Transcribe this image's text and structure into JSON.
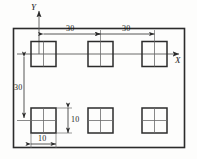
{
  "diagram": {
    "kind": "engineering-dimension-drawing",
    "colors": {
      "line": "#2b2b2b",
      "thin_line": "#5a5a5a",
      "background": "#fdfdfc",
      "text": "#1b1b1b"
    },
    "axes": {
      "x_label": "X",
      "y_label": "Y"
    },
    "dimensions": [
      {
        "name": "pitch-horizontal-1",
        "value": "30",
        "orientation": "horizontal"
      },
      {
        "name": "pitch-horizontal-2",
        "value": "30",
        "orientation": "horizontal"
      },
      {
        "name": "pitch-vertical",
        "value": "30",
        "orientation": "vertical"
      },
      {
        "name": "square-height",
        "value": "10",
        "orientation": "vertical"
      },
      {
        "name": "square-width",
        "value": "10",
        "orientation": "horizontal"
      }
    ],
    "squares": [
      {
        "name": "square-top-left",
        "row": "top",
        "col": 1
      },
      {
        "name": "square-top-center",
        "row": "top",
        "col": 2
      },
      {
        "name": "square-top-right",
        "row": "top",
        "col": 3
      },
      {
        "name": "square-bottom-left",
        "row": "bottom",
        "col": 1
      },
      {
        "name": "square-bottom-center",
        "row": "bottom",
        "col": 2
      },
      {
        "name": "square-bottom-right",
        "row": "bottom",
        "col": 3
      }
    ]
  }
}
